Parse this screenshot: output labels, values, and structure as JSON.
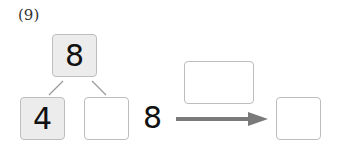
{
  "problem": {
    "label": "(9)",
    "whole": "8",
    "part_known": "4",
    "part_unknown": "",
    "expression_start": "8",
    "operation_box": "",
    "result_box": ""
  },
  "colors": {
    "box_border": "#bdbdbd",
    "filled_box": "#ececec",
    "arrow": "#7a7a7a"
  }
}
